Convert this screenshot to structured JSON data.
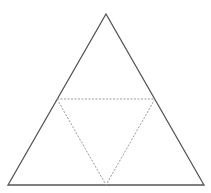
{
  "diagram": {
    "type": "geometry",
    "outer_triangle": {
      "points": [
        [
          106,
          14
        ],
        [
          8,
          185
        ],
        [
          204,
          185
        ]
      ],
      "stroke": "#555555",
      "stroke_width": 1.3,
      "style": "solid"
    },
    "medial_triangle": {
      "points": [
        [
          57,
          99
        ],
        [
          155,
          99
        ],
        [
          106,
          185
        ]
      ],
      "stroke": "#9a9a9a",
      "stroke_width": 1,
      "style": "dashed"
    },
    "background": "#ffffff"
  }
}
